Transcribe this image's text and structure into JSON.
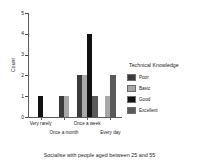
{
  "chart_data": {
    "type": "bar",
    "title": "",
    "footer_title": "Socialise with people aged between 25 and 55",
    "xlabel": "",
    "ylabel": "Count",
    "ylim": [
      0,
      5
    ],
    "yticks": [
      "0",
      "1",
      "2",
      "3",
      "4",
      "5"
    ],
    "grid": false,
    "legend_title": "Technical Knowledge",
    "legend_position": "right",
    "categories": [
      "Very rarely",
      "Once a month",
      "Once a week",
      "Every day"
    ],
    "series": [
      {
        "name": "Poor",
        "color": "#3b3b3b",
        "values": [
          0,
          1,
          2,
          0
        ]
      },
      {
        "name": "Basic",
        "color": "#a8a8a8",
        "values": [
          0,
          1,
          2,
          1
        ]
      },
      {
        "name": "Good",
        "color": "#111111",
        "values": [
          1,
          0,
          4,
          0
        ]
      },
      {
        "name": "Excellent",
        "color": "#5a5a5a",
        "values": [
          0,
          0,
          1,
          2
        ]
      }
    ]
  },
  "legend": {
    "title": "Technical Knowledge",
    "items": [
      {
        "label": "Poor",
        "color": "#3b3b3b"
      },
      {
        "label": "Basic",
        "color": "#a8a8a8"
      },
      {
        "label": "Good",
        "color": "#111111"
      },
      {
        "label": "Excellent",
        "color": "#5a5a5a"
      }
    ]
  },
  "axis": {
    "y_label": "Count",
    "y_ticks": [
      "5",
      "4",
      "3",
      "2",
      "1",
      "0"
    ],
    "x_labels": [
      "Very rarely",
      "Once a month",
      "Once a week",
      "Every day"
    ]
  },
  "footer": {
    "title": "Socialise with people aged between 25 and 55"
  }
}
